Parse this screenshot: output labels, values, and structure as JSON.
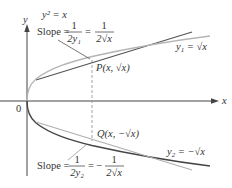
{
  "figure": {
    "equation": "y² = x",
    "axes": {
      "x_label": "x",
      "y_label": "y",
      "origin_label": "0"
    },
    "upper_branch": {
      "label_prefix": "y",
      "label_subscript": "1",
      "label_rest": " = √x",
      "point_label": "P(x, √x)",
      "slope_text": "Slope = ",
      "slope_frac1_num": "1",
      "slope_frac1_den": "2y₁",
      "slope_eq": "=",
      "slope_frac2_num": "1",
      "slope_frac2_den": "2√x"
    },
    "lower_branch": {
      "label_prefix": "y",
      "label_subscript": "2",
      "label_rest": " = −√x",
      "point_label": "Q(x, −√x)",
      "slope_text": "Slope = ",
      "slope_frac1_num": "1",
      "slope_frac1_den": "2y₂",
      "slope_eq": "= −",
      "slope_frac2_num": "1",
      "slope_frac2_den": "2√x"
    },
    "colors": {
      "curve_upper": "#b5b5b5",
      "curve_lower": "#444444",
      "tangent_upper": "#555555",
      "tangent_lower": "#b0b0b0",
      "axis": "#444444",
      "dashed": "#9a9a9a"
    }
  }
}
